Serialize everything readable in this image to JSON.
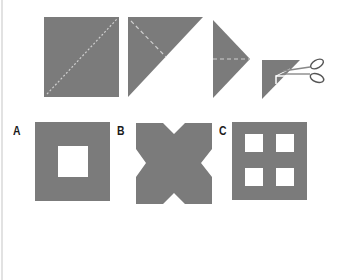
{
  "diagram": {
    "fill_color": "#7b7b7b",
    "hole_color": "#ffffff",
    "fold_line_color": "#cfcfcf",
    "steps": [
      {
        "name": "unfolded-square",
        "description": "Square with diagonal fold line"
      },
      {
        "name": "folded-triangle",
        "description": "Square folded diagonally into triangle, with fold line"
      },
      {
        "name": "folded-small-triangle",
        "description": "Triangle folded in half, horizontal fold line"
      },
      {
        "name": "cut-triangle",
        "description": "Final folded triangle with a corner cut by scissors"
      }
    ],
    "options": [
      {
        "label": "A",
        "description": "Square with one central square hole"
      },
      {
        "label": "B",
        "description": "Square with triangular notch cut in each side (X shape)"
      },
      {
        "label": "C",
        "description": "Square with four square holes in a 2x2 grid"
      }
    ],
    "icons": {
      "scissors": "scissors-icon"
    }
  }
}
